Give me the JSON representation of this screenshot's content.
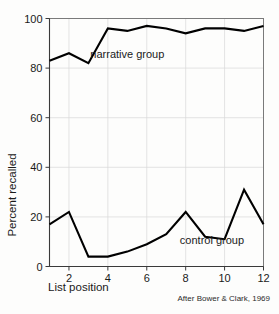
{
  "figure": {
    "credit": "After Bower & Clark, 1969"
  },
  "chart_data": {
    "type": "line",
    "title": "",
    "xlabel": "List position",
    "ylabel": "Percent recalled",
    "xlim": [
      1,
      12
    ],
    "ylim": [
      0,
      100
    ],
    "grid": true,
    "legend_position": "inline-annotation",
    "x": [
      1,
      2,
      3,
      4,
      5,
      6,
      7,
      8,
      9,
      10,
      11,
      12
    ],
    "xticks": [
      2,
      4,
      6,
      8,
      10,
      12
    ],
    "xticklabels": [
      "2",
      "4",
      "6",
      "8",
      "10",
      "12"
    ],
    "yticks": [
      0,
      20,
      40,
      60,
      80,
      100
    ],
    "yticklabels": [
      "0",
      "20",
      "40",
      "60",
      "80",
      "100"
    ],
    "series": [
      {
        "name": "narrative group",
        "label": "narrative group",
        "color": "#000000",
        "values": [
          83,
          86,
          82,
          96,
          95,
          97,
          96,
          94,
          96,
          96,
          95,
          97
        ],
        "annotation": {
          "text": "narrative group",
          "x": 3.1,
          "y": 84
        }
      },
      {
        "name": "control group",
        "label": "control group",
        "color": "#000000",
        "values": [
          17,
          22,
          4,
          4,
          6,
          9,
          13,
          22,
          12,
          11,
          31,
          17
        ],
        "annotation": {
          "text": "control group",
          "x": 7.7,
          "y": 9
        }
      }
    ]
  }
}
